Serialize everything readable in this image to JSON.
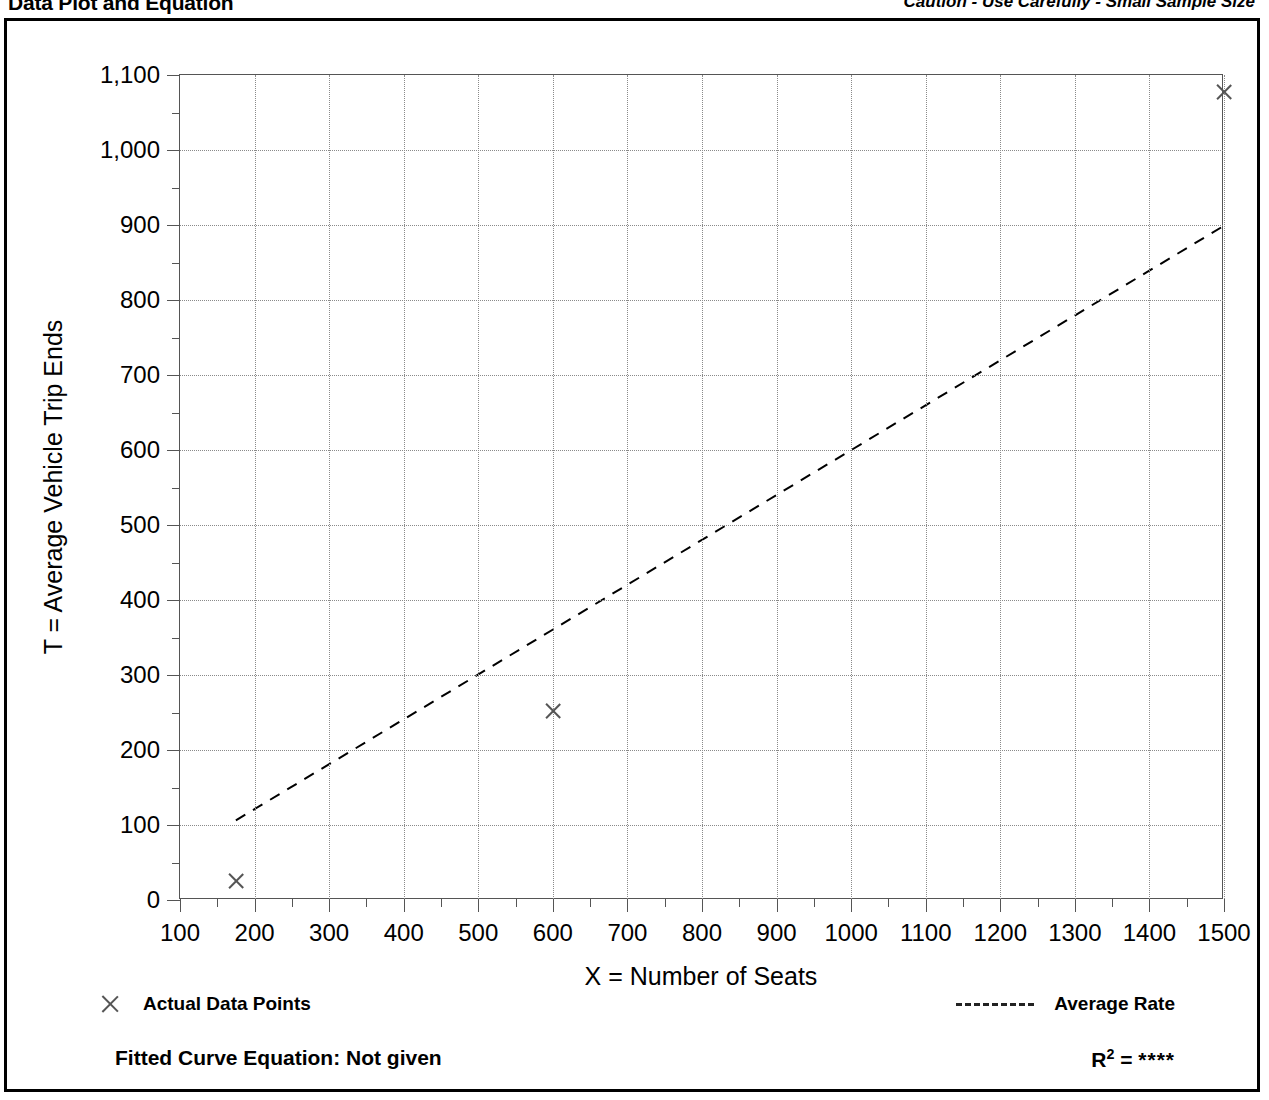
{
  "header": {
    "title": "Data Plot and Equation",
    "caution": "Caution - Use Carefully - Small Sample Size"
  },
  "legend": {
    "points_label": "Actual Data Points",
    "line_label": "Average Rate",
    "point_marker": "x-marker-icon",
    "line_marker": "dashed-line-icon"
  },
  "footer": {
    "equation_label": "Fitted Curve Equation:  Not given",
    "r2_prefix": "R",
    "r2_exponent": "2",
    "r2_equals": " = ",
    "r2_value": "****"
  },
  "chart_data": {
    "type": "scatter",
    "title": "Data Plot and Equation",
    "subtitle": "Caution - Use Carefully - Small Sample Size",
    "xlabel": "X = Number of Seats",
    "ylabel": "T = Average Vehicle Trip Ends",
    "xlim": [
      100,
      1500
    ],
    "ylim": [
      0,
      1100
    ],
    "xticks": [
      100,
      200,
      300,
      400,
      500,
      600,
      700,
      800,
      900,
      1000,
      1100,
      1200,
      1300,
      1400,
      1500
    ],
    "xticklabels": [
      "100",
      "200",
      "300",
      "400",
      "500",
      "600",
      "700",
      "800",
      "900",
      "1000",
      "1100",
      "1200",
      "1300",
      "1400",
      "1500"
    ],
    "yticks": [
      0,
      100,
      200,
      300,
      400,
      500,
      600,
      700,
      800,
      900,
      1000,
      1100
    ],
    "yticklabels": [
      "0",
      "100",
      "200",
      "300",
      "400",
      "500",
      "600",
      "700",
      "800",
      "900",
      "1,000",
      "1,100"
    ],
    "x_minor_ticks": true,
    "y_minor_ticks": true,
    "grid": true,
    "grid_style": "dotted",
    "legend_position": "below-plot",
    "series": [
      {
        "name": "Actual Data Points",
        "type": "scatter",
        "marker": "x",
        "points": [
          {
            "x": 175,
            "y": 25
          },
          {
            "x": 600,
            "y": 252
          },
          {
            "x": 1500,
            "y": 1078
          }
        ]
      },
      {
        "name": "Average Rate",
        "type": "line",
        "style": "dashed",
        "through_origin": true,
        "slope": 0.599,
        "endpoints": [
          {
            "x": 175,
            "y": 105
          },
          {
            "x": 1500,
            "y": 898
          }
        ]
      }
    ]
  },
  "colors": {
    "axis": "#555555",
    "grid": "#8a8a8a",
    "text": "#000000",
    "frame": "#000000"
  }
}
